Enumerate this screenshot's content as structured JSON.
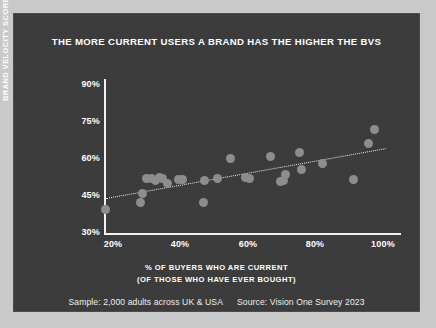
{
  "panel": {
    "background_color": "#3b3b3b",
    "canvas_color": "#c9c9c9"
  },
  "chart_data": {
    "type": "scatter",
    "title": "THE MORE CURRENT USERS A BRAND HAS THE HIGHER THE BVS",
    "xlabel": "% OF BUYERS WHO ARE CURRENT",
    "xlabel_line2": "(OF THOSE WHO HAVE EVER BOUGHT)",
    "ylabel": "BRAND VELOCITY SCORE (BVS)",
    "xlim": [
      20,
      108
    ],
    "ylim": [
      30,
      90
    ],
    "xticks": [
      "20%",
      "40%",
      "60%",
      "80%",
      "100%"
    ],
    "xtick_values": [
      20,
      40,
      60,
      80,
      100
    ],
    "yticks": [
      "90%",
      "75%",
      "60%",
      "45%",
      "30%"
    ],
    "ytick_values": [
      90,
      75,
      60,
      45,
      30
    ],
    "grid": false,
    "legend": null,
    "point_color": "#8d8d8d",
    "trendline_color": "#efefef",
    "trendline_style": "dotted",
    "trendline": {
      "x0": 20.5,
      "y0": 43.8,
      "x1": 104.0,
      "y1": 63.5
    },
    "points": [
      {
        "x": 20.3,
        "y": 39.3
      },
      {
        "x": 30.8,
        "y": 42.0
      },
      {
        "x": 31.6,
        "y": 45.6
      },
      {
        "x": 32.6,
        "y": 51.5
      },
      {
        "x": 34.2,
        "y": 51.4
      },
      {
        "x": 35.4,
        "y": 50.8
      },
      {
        "x": 36.6,
        "y": 52.0
      },
      {
        "x": 37.5,
        "y": 51.4
      },
      {
        "x": 38.9,
        "y": 49.4
      },
      {
        "x": 42.1,
        "y": 51.3
      },
      {
        "x": 43.5,
        "y": 51.2
      },
      {
        "x": 49.6,
        "y": 41.9
      },
      {
        "x": 50.1,
        "y": 50.6
      },
      {
        "x": 54.0,
        "y": 51.7
      },
      {
        "x": 57.6,
        "y": 59.5
      },
      {
        "x": 62.2,
        "y": 51.8
      },
      {
        "x": 63.4,
        "y": 51.6
      },
      {
        "x": 69.6,
        "y": 60.2
      },
      {
        "x": 72.6,
        "y": 50.3
      },
      {
        "x": 73.6,
        "y": 50.7
      },
      {
        "x": 74.1,
        "y": 53.0
      },
      {
        "x": 78.4,
        "y": 61.6
      },
      {
        "x": 78.8,
        "y": 55.0
      },
      {
        "x": 85.3,
        "y": 57.6
      },
      {
        "x": 94.4,
        "y": 51.3
      },
      {
        "x": 98.9,
        "y": 65.3
      },
      {
        "x": 100.6,
        "y": 71.0
      }
    ]
  },
  "footer": {
    "sample": "Sample: 2,000 adults across UK & USA",
    "source": "Source: Vision One Survey 2023"
  }
}
